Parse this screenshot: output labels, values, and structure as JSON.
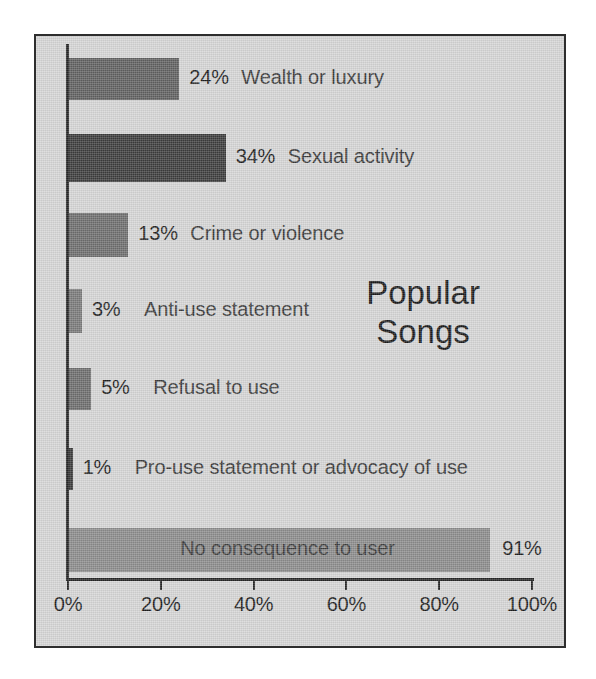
{
  "chart_data": {
    "type": "bar",
    "orientation": "horizontal",
    "title": "Popular Songs",
    "title_lines": [
      "Popular",
      "Songs"
    ],
    "xlabel": "",
    "ylabel": "",
    "xlim": [
      0,
      100
    ],
    "grid": false,
    "legend": false,
    "unit": "%",
    "xticks": [
      0,
      20,
      40,
      60,
      80,
      100
    ],
    "xtick_labels": [
      "0%",
      "20%",
      "40%",
      "60%",
      "80%",
      "100%"
    ],
    "categories": [
      "Wealth or luxury",
      "Sexual activity",
      "Crime or violence",
      "Anti-use statement",
      "Refusal to use",
      "Pro-use statement or advocacy of use",
      "No consequence to user"
    ],
    "values": [
      24,
      34,
      13,
      3,
      5,
      1,
      91
    ],
    "value_labels": [
      "24%",
      "34%",
      "13%",
      "3%",
      "5%",
      "1%",
      "91%"
    ],
    "bar_colors": [
      "#616161",
      "#3d3d3d",
      "#6e6e6e",
      "#7a7a7a",
      "#6d6d6d",
      "#3a3a3a",
      "#8c8c8c"
    ],
    "label_placement": [
      "outside",
      "outside",
      "outside",
      "outside",
      "outside",
      "outside",
      "inside"
    ]
  },
  "bars": [
    {
      "label": "Wealth or luxury",
      "value_label": "24%",
      "value": 24,
      "top": 22,
      "height": 42,
      "color": "#616161",
      "inside": false
    },
    {
      "label": "Sexual activity",
      "value_label": "34%",
      "value": 34,
      "top": 98,
      "height": 48,
      "color": "#3d3d3d",
      "inside": false
    },
    {
      "label": "Crime or violence",
      "value_label": "13%",
      "value": 13,
      "top": 177,
      "height": 44,
      "color": "#6e6e6e",
      "inside": false
    },
    {
      "label": "Anti-use statement",
      "value_label": "3%",
      "value": 3,
      "top": 253,
      "height": 44,
      "color": "#7a7a7a",
      "inside": false
    },
    {
      "label": "Refusal to use",
      "value_label": "5%",
      "value": 5,
      "top": 332,
      "height": 42,
      "color": "#6d6d6d",
      "inside": false
    },
    {
      "label": "Pro-use statement or advocacy of use",
      "value_label": "1%",
      "value": 1,
      "top": 412,
      "height": 42,
      "color": "#3a3a3a",
      "inside": false
    },
    {
      "label": "No consequence to user",
      "value_label": "91%",
      "value": 91,
      "top": 492,
      "height": 44,
      "color": "#8c8c8c",
      "inside": true
    }
  ],
  "axis": {
    "ticks": [
      {
        "label": "0%",
        "value": 0
      },
      {
        "label": "20%",
        "value": 20
      },
      {
        "label": "40%",
        "value": 40
      },
      {
        "label": "60%",
        "value": 60
      },
      {
        "label": "80%",
        "value": 80
      },
      {
        "label": "100%",
        "value": 100
      }
    ]
  },
  "colors": {
    "background": "#d6d6d6",
    "border": "#2e2e2e",
    "axis": "#262626",
    "text": "#1d1d1d",
    "label_text": "#3a3a3a"
  }
}
